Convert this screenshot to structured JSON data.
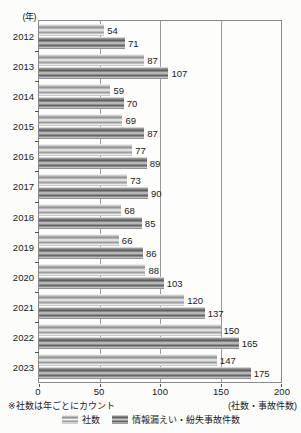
{
  "chart_data": {
    "type": "bar",
    "orientation": "horizontal",
    "categories": [
      "2012",
      "2013",
      "2014",
      "2015",
      "2016",
      "2017",
      "2018",
      "2019",
      "2020",
      "2021",
      "2022",
      "2023"
    ],
    "series": [
      {
        "name": "社数",
        "values": [
          54,
          87,
          59,
          69,
          77,
          73,
          68,
          66,
          88,
          120,
          150,
          147
        ]
      },
      {
        "name": "情報漏えい・紛失事故件数",
        "values": [
          71,
          107,
          70,
          87,
          89,
          90,
          85,
          86,
          103,
          137,
          165,
          175
        ]
      }
    ],
    "xlim": [
      0,
      200
    ],
    "xticks": [
      0,
      50,
      100,
      150,
      200
    ],
    "y_axis_unit": "(年)",
    "x_axis_unit": "(社数・事故件数)",
    "note": "※社数は年ごとにカウント",
    "grid": true,
    "legend_position": "bottom",
    "colors": {
      "series1_light": "#d9d9d9",
      "series2_dark": "#7a7a7a",
      "border": "#8a8a8a",
      "text": "#1a1a1a"
    }
  }
}
